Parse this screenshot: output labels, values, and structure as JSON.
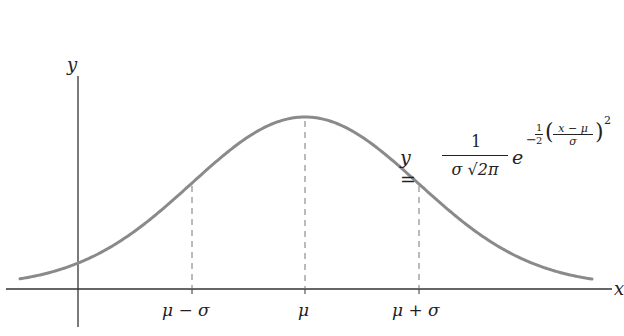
{
  "chart_data": {
    "type": "line",
    "xlabel": "x",
    "ylabel": "y",
    "equation": "y = 1/(σ√(2π)) · e^(−½((x−μ)/σ)²)",
    "tick_labels": [
      "μ − σ",
      "μ",
      "μ + σ"
    ],
    "annotations": [
      "dashed vertical line at μ − σ",
      "dashed vertical line at μ (peak)",
      "dashed vertical line at μ + σ"
    ],
    "x": [
      -3,
      -2,
      -1,
      0,
      1,
      2,
      3
    ],
    "x_units": "standard deviations from μ",
    "values": [
      0.011,
      0.135,
      0.607,
      1.0,
      0.607,
      0.135,
      0.011
    ],
    "values_note": "relative to peak height",
    "grid": false,
    "legend": "none",
    "color": "#8a8a8a"
  },
  "labels": {
    "y_axis": "y",
    "x_axis": "x",
    "tick_mu_minus_sigma": "μ − σ",
    "tick_mu": "μ",
    "tick_mu_plus_sigma": "μ + σ"
  },
  "formula": {
    "lhs": "y =",
    "numerator": "1",
    "denominator": "σ √2π",
    "base": "e",
    "exp_sign": "−",
    "exp_half_num": "1",
    "exp_half_den": "2",
    "exp_inner_num": "x − μ",
    "exp_inner_den": "σ",
    "exp_power": "2"
  }
}
